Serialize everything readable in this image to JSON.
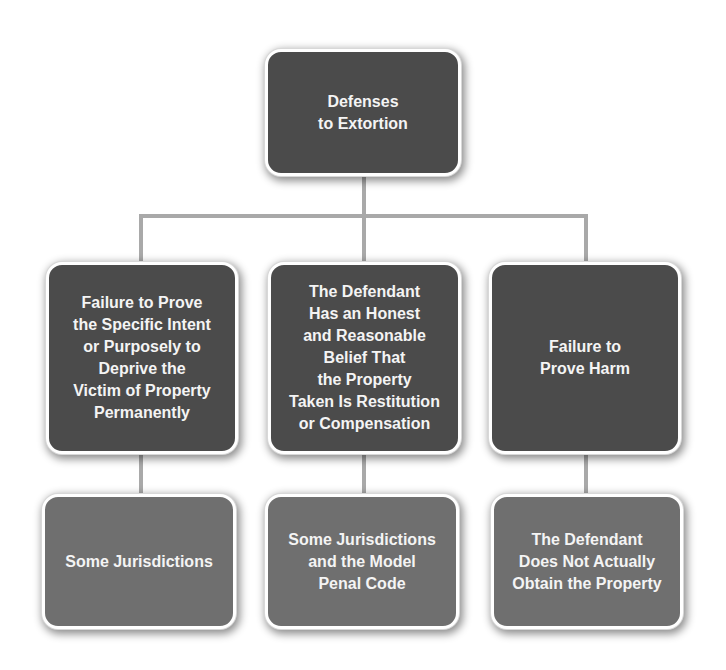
{
  "diagram": {
    "type": "hierarchy",
    "colors": {
      "root_fill": "#4b4b4b",
      "level1_fill": "#4b4b4b",
      "level2_fill": "#6f6f6f",
      "connector": "#a9a9a9",
      "text": "#f4f4f4",
      "border": "#ffffff"
    },
    "root": {
      "label": "Defenses\nto Extortion"
    },
    "branches": [
      {
        "label": "Failure to Prove\nthe Specific Intent\nor Purposely to\nDeprive the\nVictim of Property\nPermanently",
        "child": {
          "label": "Some Jurisdictions"
        }
      },
      {
        "label": "The Defendant\nHas an Honest\nand Reasonable\nBelief That\nthe Property\nTaken Is Restitution\nor Compensation",
        "child": {
          "label": "Some Jurisdictions\nand the Model\nPenal Code"
        }
      },
      {
        "label": "Failure to\nProve Harm",
        "child": {
          "label": "The Defendant\nDoes Not Actually\nObtain the Property"
        }
      }
    ]
  }
}
